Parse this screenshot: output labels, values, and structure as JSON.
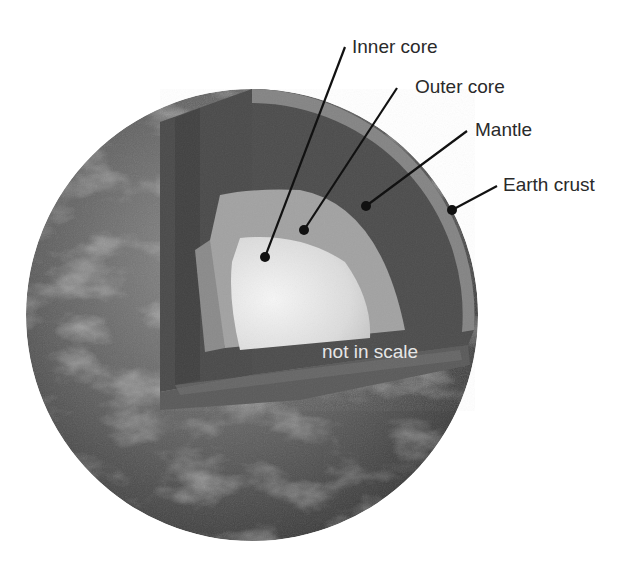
{
  "diagram": {
    "colors": {
      "background": "#ffffff",
      "label_text": "#2a2a2a",
      "leader_line": "#111111",
      "note_text": "#e6e6e6",
      "inner_core": "#e8e8e8",
      "outer_core": "#a9a9a9",
      "mantle": "#555555",
      "crust": "#8a8a8a",
      "surface": "#5a5a5a"
    },
    "labels": [
      {
        "id": "inner-core",
        "text": "Inner core"
      },
      {
        "id": "outer-core",
        "text": "Outer core"
      },
      {
        "id": "mantle",
        "text": "Mantle"
      },
      {
        "id": "earth-crust",
        "text": "Earth crust"
      }
    ],
    "note": "not in scale"
  }
}
